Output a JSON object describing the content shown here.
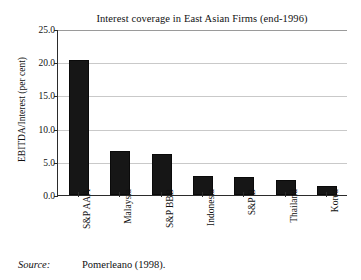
{
  "figure": {
    "title": "Interest coverage in East Asian Firms (end-1996)",
    "source_label": "Source:",
    "source_text": "Pomerleano (1998).",
    "clipped_top_text": ""
  },
  "chart_data": {
    "type": "bar",
    "title": "Interest coverage in East Asian Firms (end-1996)",
    "xlabel": "",
    "ylabel": "EBITDA/Interest (per cent)",
    "categories": [
      "S&P AAA",
      "Malaysia",
      "S&P BBB",
      "Indonesia",
      "S&P B",
      "Thailand",
      "Korea"
    ],
    "values": [
      20.3,
      6.7,
      6.2,
      2.8,
      2.7,
      2.3,
      1.3
    ],
    "ylim": [
      0.0,
      25.0
    ],
    "ytick_labels": [
      "25.0",
      "20.0",
      "15.0",
      "10.0",
      "5.0",
      "0.0"
    ],
    "ytick_values": [
      25.0,
      20.0,
      15.0,
      10.0,
      5.0,
      0.0
    ],
    "grid": true,
    "legend": "none",
    "bar_color": "#161616",
    "axis_color": "#2b2b2b",
    "gridline_color": "#c9c9c9"
  }
}
